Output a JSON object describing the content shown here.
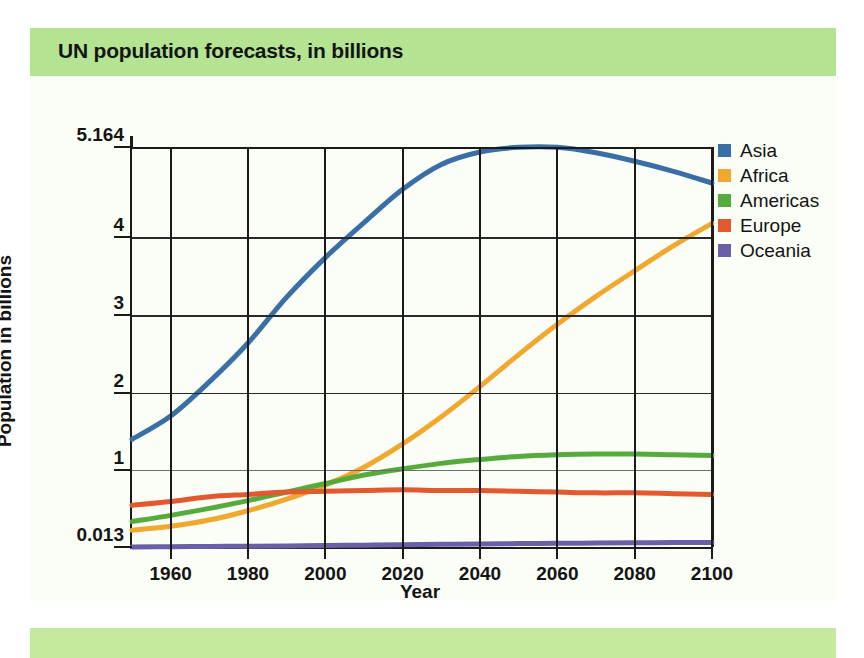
{
  "title": "UN population forecasts, in billions",
  "colors": {
    "title_band": "#b4e492",
    "bottom_band": "#c3ea9f",
    "paper": "#fbfdf7",
    "axis": "#1a1a1a",
    "asia": "#3a6fa5",
    "africa": "#f0a92e",
    "americas": "#56ab3d",
    "europe": "#e1592d",
    "oceania": "#6a5fa8"
  },
  "legend": {
    "position": "right",
    "items": [
      {
        "label": "Asia",
        "color": "#3a6fa5"
      },
      {
        "label": "Africa",
        "color": "#f0a92e"
      },
      {
        "label": "Americas",
        "color": "#56ab3d"
      },
      {
        "label": "Europe",
        "color": "#e1592d"
      },
      {
        "label": "Oceania",
        "color": "#6a5fa8"
      }
    ]
  },
  "chart_data": {
    "type": "line",
    "title": "UN population forecasts, in billions",
    "xlabel": "Year",
    "ylabel": "Population in billions",
    "xlim": [
      1950,
      2100
    ],
    "ylim": [
      0.013,
      5.164
    ],
    "grid": true,
    "xticks": [
      1960,
      1980,
      2000,
      2020,
      2040,
      2060,
      2080,
      2100
    ],
    "xtick_labels": [
      "1960",
      "1980",
      "2000",
      "2020",
      "2040",
      "2060",
      "2080",
      "2100"
    ],
    "yticks": [
      0.013,
      1,
      2,
      3,
      4,
      5.164
    ],
    "ytick_labels": [
      "0.013",
      "1",
      "2",
      "3",
      "4",
      "5.164"
    ],
    "x": [
      1950,
      1960,
      1970,
      1980,
      1990,
      2000,
      2010,
      2020,
      2030,
      2040,
      2050,
      2060,
      2070,
      2080,
      2090,
      2100
    ],
    "series": [
      {
        "name": "Asia",
        "color": "#3a6fa5",
        "values": [
          1.4,
          1.7,
          2.14,
          2.64,
          3.23,
          3.74,
          4.19,
          4.62,
          4.94,
          5.1,
          5.16,
          5.16,
          5.09,
          4.98,
          4.85,
          4.7
        ]
      },
      {
        "name": "Africa",
        "color": "#f0a92e",
        "values": [
          0.23,
          0.28,
          0.36,
          0.48,
          0.63,
          0.81,
          1.04,
          1.34,
          1.69,
          2.08,
          2.49,
          2.88,
          3.24,
          3.57,
          3.89,
          4.18
        ]
      },
      {
        "name": "Americas",
        "color": "#56ab3d",
        "values": [
          0.34,
          0.42,
          0.51,
          0.61,
          0.72,
          0.83,
          0.94,
          1.02,
          1.09,
          1.14,
          1.18,
          1.2,
          1.21,
          1.21,
          1.2,
          1.19
        ]
      },
      {
        "name": "Europe",
        "color": "#e1592d",
        "values": [
          0.55,
          0.6,
          0.66,
          0.69,
          0.72,
          0.73,
          0.74,
          0.75,
          0.74,
          0.74,
          0.73,
          0.72,
          0.71,
          0.71,
          0.7,
          0.69
        ]
      },
      {
        "name": "Oceania",
        "color": "#6a5fa8",
        "values": [
          0.013,
          0.016,
          0.02,
          0.023,
          0.027,
          0.031,
          0.037,
          0.043,
          0.048,
          0.053,
          0.057,
          0.061,
          0.064,
          0.067,
          0.07,
          0.072
        ]
      }
    ]
  }
}
